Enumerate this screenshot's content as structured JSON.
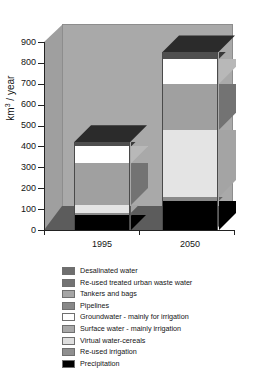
{
  "chart_data": {
    "type": "bar",
    "subtype": "stacked-column-3d",
    "title": "",
    "xlabel": "",
    "ylabel": "km3 / year",
    "ylabel_html": "km<sup>3</sup> / year",
    "ylim": [
      0,
      900
    ],
    "ytick_step": 100,
    "yticks": [
      "900",
      "800",
      "700",
      "600",
      "500",
      "400",
      "300",
      "200",
      "100",
      "0"
    ],
    "ytick_values": [
      900,
      800,
      700,
      600,
      500,
      400,
      300,
      200,
      100,
      0
    ],
    "grid": false,
    "legend_position": "bottom",
    "categories": [
      "1995",
      "2050"
    ],
    "series": [
      {
        "name": "Precipitation",
        "values": [
          70,
          140
        ],
        "color": "#000000"
      },
      {
        "name": "Re-used irrigation",
        "values": [
          12,
          18
        ],
        "color": "#8a8a8a"
      },
      {
        "name": "Virtual water-cereals",
        "values": [
          38,
          322
        ],
        "color": "#e4e4e4"
      },
      {
        "name": "Surface water - mainly irrigation",
        "values": [
          200,
          220
        ],
        "color": "#a0a0a0"
      },
      {
        "name": "Groundwater - mainly for irrigation",
        "values": [
          80,
          120
        ],
        "color": "#ffffff"
      },
      {
        "name": "Pipelines",
        "values": [
          0,
          0
        ],
        "color": "#989898"
      },
      {
        "name": "Tankers and bags",
        "values": [
          0,
          0
        ],
        "color": "#9e9e9e"
      },
      {
        "name": "Re-used treated urban waste water",
        "values": [
          0,
          0
        ],
        "color": "#767676"
      },
      {
        "name": "Desalinated water",
        "values": [
          20,
          30
        ],
        "color": "#4f4f4f"
      }
    ],
    "totals": [
      420,
      850
    ],
    "legend": [
      {
        "label": "Desalinated water",
        "color": "#6e6e6e"
      },
      {
        "label": "Re-used treated urban waste water",
        "color": "#737373"
      },
      {
        "label": "Tankers and bags",
        "color": "#a5a5a5"
      },
      {
        "label": "Pipelines",
        "color": "#888888"
      },
      {
        "label": "Groundwater - mainly for irrigation",
        "color": "#ffffff"
      },
      {
        "label": "Surface water - mainly irrigation",
        "color": "#a8a8a8"
      },
      {
        "label": "Virtual water-cereals",
        "color": "#dedede"
      },
      {
        "label": "Re-used irrigation",
        "color": "#8f8f8f"
      },
      {
        "label": "Precipitation",
        "color": "#000000"
      }
    ],
    "colors": {
      "background": "#ffffff",
      "plot_back_wall": "#a9a9a9",
      "plot_side_wall": "#9f9f9f",
      "plot_floor": "#5c5c5c",
      "axis": "#222222",
      "text": "#141414"
    }
  }
}
